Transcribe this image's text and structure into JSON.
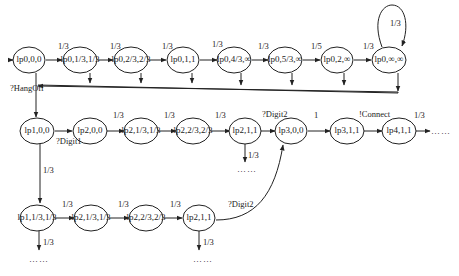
{
  "diagram": {
    "type": "state-transition-graph",
    "nodes": [
      {
        "id": "n00",
        "label": "lp0,0,0",
        "x": 29,
        "y": 60
      },
      {
        "id": "n01",
        "label": "lp0,1/3,1/3",
        "x": 80,
        "y": 60
      },
      {
        "id": "n02",
        "label": "lp0,2/3,2/3",
        "x": 131,
        "y": 60
      },
      {
        "id": "n03",
        "label": "lp0,1,1",
        "x": 183,
        "y": 60
      },
      {
        "id": "n04",
        "label": "lp0,4/3,∞",
        "x": 234,
        "y": 60
      },
      {
        "id": "n05",
        "label": "lp0,5/3,∞",
        "x": 285,
        "y": 60
      },
      {
        "id": "n06",
        "label": "lp0,2,∞",
        "x": 337,
        "y": 60
      },
      {
        "id": "n07",
        "label": "lp0,∞,∞",
        "x": 389,
        "y": 60
      },
      {
        "id": "r1a",
        "label": "lp1,0,0",
        "x": 37,
        "y": 131
      },
      {
        "id": "r1b",
        "label": "lp2,0,0",
        "x": 90,
        "y": 131
      },
      {
        "id": "r1c",
        "label": "lp2,1/3,1/3",
        "x": 141,
        "y": 131
      },
      {
        "id": "r1d",
        "label": "lp2,2/3,2/3",
        "x": 193,
        "y": 131
      },
      {
        "id": "r1e",
        "label": "lp2,1,1",
        "x": 245,
        "y": 131
      },
      {
        "id": "r1f",
        "label": "lp3,0,0",
        "x": 291,
        "y": 131
      },
      {
        "id": "r1g",
        "label": "lp3,1,1",
        "x": 347,
        "y": 131
      },
      {
        "id": "r1h",
        "label": "lp4,1,1",
        "x": 399,
        "y": 131
      },
      {
        "id": "r2a",
        "label": "lp1,1/3,1/3",
        "x": 37,
        "y": 218
      },
      {
        "id": "r2b",
        "label": "lp2,1/3,1/3",
        "x": 91,
        "y": 218
      },
      {
        "id": "r2c",
        "label": "lp2,2/3,2/3",
        "x": 146,
        "y": 218
      },
      {
        "id": "r2d",
        "label": "lp2,1,1",
        "x": 199,
        "y": 218
      }
    ],
    "edge_labels": {
      "top": [
        "1/3",
        "1/3",
        "1/3",
        "1/3",
        "1/3",
        "1/5",
        "1/3"
      ],
      "self_loop": "1/3",
      "hangoff": "?HangOff",
      "digit1": "?Digit1",
      "row1": [
        "1/3",
        "1/3",
        "1/3"
      ],
      "digit2_a": "?Digit2",
      "one": "1",
      "connect": "!Connect",
      "after_connect": "1/3",
      "down_from_lp1": "1/3",
      "down_from_lp2_111": "1/3",
      "row2": [
        "1/3",
        "1/3",
        "1/3"
      ],
      "digit2_b": "?Digit2",
      "down_r2a": "1/3",
      "down_r2d": "1/3"
    },
    "continuation": "……"
  }
}
